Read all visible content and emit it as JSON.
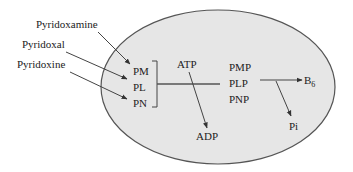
{
  "diagram": {
    "type": "metabolic-pathway",
    "colors": {
      "cell_fill": "#e6e6e6",
      "cell_stroke": "#555555",
      "line": "#444444",
      "text": "#222222"
    },
    "external_inputs": [
      {
        "label": "Pyridoxamine",
        "target": "PM"
      },
      {
        "label": "Pyridoxal",
        "target": "PL"
      },
      {
        "label": "Pyridoxine",
        "target": "PN"
      }
    ],
    "vitamers": [
      "PM",
      "PL",
      "PN"
    ],
    "cofactor_in": "ATP",
    "cofactor_out": "ADP",
    "phosphorylated": [
      "PMP",
      "PLP",
      "PNP"
    ],
    "product": {
      "base": "B",
      "subscript": "6"
    },
    "byproduct": "Pi"
  }
}
